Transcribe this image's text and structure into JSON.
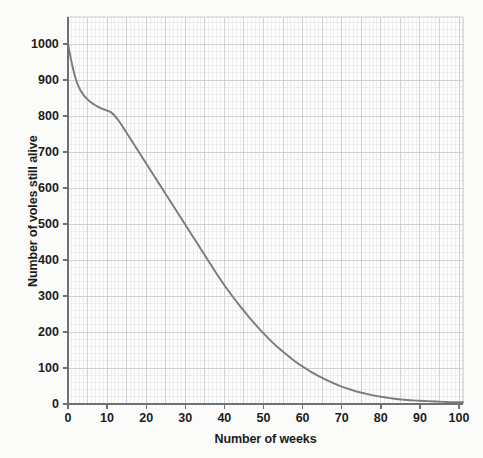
{
  "chart_data": {
    "type": "line",
    "title": "",
    "subtitle": "",
    "xlabel": "Number of weeks",
    "ylabel": "Number of voles still alive",
    "xlim": [
      0,
      101
    ],
    "ylim": [
      0,
      1075
    ],
    "grid": true,
    "grid_minor_step_x": 1,
    "grid_minor_step_y": 20,
    "grid_major_step_x": 5,
    "grid_major_step_y": 100,
    "legend": null,
    "legend_position": "none",
    "xticks": [
      0,
      10,
      20,
      30,
      40,
      50,
      60,
      70,
      80,
      90,
      100
    ],
    "xtick_labels": [
      "0",
      "10",
      "20",
      "30",
      "40",
      "50",
      "60",
      "70",
      "80",
      "90",
      "100"
    ],
    "yticks": [
      0,
      100,
      200,
      300,
      400,
      500,
      600,
      700,
      800,
      900,
      1000
    ],
    "ytick_labels": [
      "0",
      "100",
      "200",
      "300",
      "400",
      "500",
      "600",
      "700",
      "800",
      "900",
      "1000"
    ],
    "series": [
      {
        "name": "voles surviving",
        "color": "#7b7b7b",
        "x": [
          0,
          1,
          2,
          3,
          4,
          5,
          6,
          7,
          8,
          9,
          10,
          11,
          12,
          13,
          14,
          15,
          16,
          18,
          20,
          22,
          24,
          26,
          28,
          30,
          32,
          34,
          36,
          38,
          40,
          42,
          44,
          46,
          48,
          50,
          52,
          54,
          56,
          58,
          60,
          62,
          64,
          66,
          68,
          70,
          72,
          74,
          76,
          78,
          80,
          82,
          84,
          86,
          88,
          90,
          92,
          94,
          96,
          98,
          100,
          101
        ],
        "values": [
          1000,
          945,
          902,
          875,
          858,
          846,
          837,
          830,
          824,
          819,
          815,
          810,
          800,
          786,
          770,
          753,
          736,
          702,
          668,
          634,
          600,
          566,
          532,
          498,
          464,
          430,
          396,
          362,
          330,
          300,
          272,
          245,
          220,
          196,
          174,
          154,
          136,
          119,
          104,
          90,
          78,
          67,
          57,
          48,
          41,
          34,
          29,
          24,
          20,
          17,
          14,
          12,
          10,
          9,
          8,
          7,
          6,
          5,
          5,
          5
        ]
      }
    ]
  },
  "axes": {
    "x_title": "Number of weeks",
    "y_title": "Number of voles still alive"
  },
  "colors": {
    "curve": "#7b7b7b",
    "grid_minor": "#e3e6e6",
    "grid_major": "#c9cdcd",
    "axis": "#6f7272",
    "background": "#fbfbfa",
    "plot_background": "#fdfdfd",
    "text": "#1c1c1c"
  }
}
